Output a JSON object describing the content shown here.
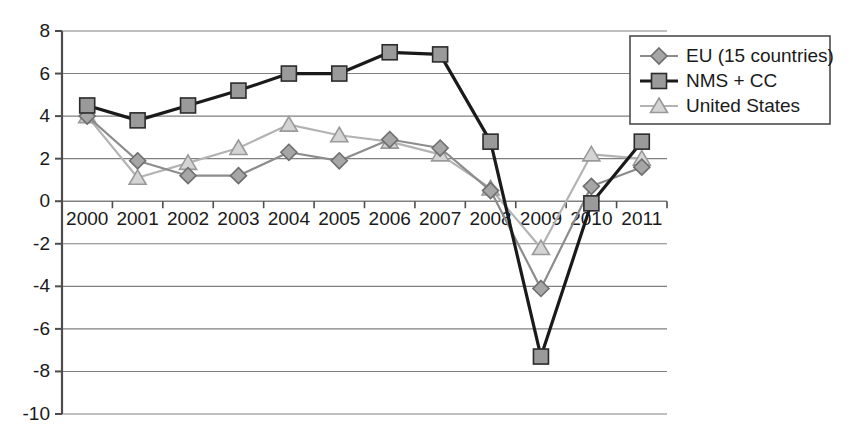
{
  "chart_data": {
    "type": "line",
    "title": "",
    "subtitle": "",
    "xlabel": "",
    "ylabel": "",
    "categories": [
      "2000",
      "2001",
      "2002",
      "2003",
      "2004",
      "2005",
      "2006",
      "2007",
      "2008",
      "2009",
      "2010",
      "2011"
    ],
    "x": [
      2000,
      2001,
      2002,
      2003,
      2004,
      2005,
      2006,
      2007,
      2008,
      2009,
      2010,
      2011
    ],
    "ylim": [
      -10,
      8
    ],
    "ytick_labels": [
      "8",
      "6",
      "4",
      "2",
      "0",
      "-2",
      "-4",
      "-6",
      "-8",
      "-10"
    ],
    "yticks": [
      8,
      6,
      4,
      2,
      0,
      -2,
      -4,
      -6,
      -8,
      -10
    ],
    "grid": "horizontal",
    "legend_position": "top-right",
    "series": [
      {
        "name": "EU (15 countries)",
        "marker": "diamond",
        "color": "#8c8c8c",
        "line_width": 2.2,
        "values": [
          4.0,
          1.9,
          1.2,
          1.2,
          2.3,
          1.9,
          2.9,
          2.5,
          0.5,
          -4.1,
          0.7,
          1.6
        ]
      },
      {
        "name": "NMS + CC",
        "marker": "square",
        "color": "#1a1a1a",
        "line_width": 3.2,
        "values": [
          4.5,
          3.8,
          4.5,
          5.2,
          6.0,
          6.0,
          7.0,
          6.9,
          2.8,
          -7.3,
          -0.1,
          2.8
        ]
      },
      {
        "name": "United States",
        "marker": "triangle",
        "color": "#b3b3b3",
        "line_width": 2.2,
        "values": [
          4.0,
          1.1,
          1.8,
          2.5,
          3.6,
          3.1,
          2.8,
          2.2,
          0.6,
          -2.2,
          2.2,
          2.0
        ]
      }
    ]
  },
  "axis": {
    "zero_line_value": 0
  },
  "colors": {
    "axis": "#4d4d4d",
    "grid": "#808080",
    "text": "#1a1a1a",
    "legend_border": "#4d4d4d",
    "background": "#ffffff"
  }
}
